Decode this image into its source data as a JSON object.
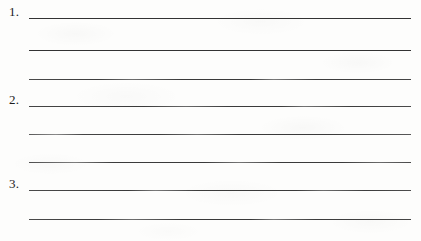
{
  "document": {
    "type": "worksheet-answer-lines",
    "title": "Numbered blank answer lines",
    "background_color": "#fdfdfc",
    "rule_color": "#3a3a3a",
    "text_color": "#1c1c1c",
    "total_rules": 8,
    "numbered_items": 3
  },
  "items": [
    {
      "number": "1.",
      "has_number": true,
      "rule_index": 1,
      "y": 18,
      "line_style": "solid",
      "text": ""
    },
    {
      "number": "",
      "has_number": false,
      "rule_index": 2,
      "y": 50,
      "line_style": "solid",
      "text": ""
    },
    {
      "number": "",
      "has_number": false,
      "rule_index": 3,
      "y": 79,
      "line_style": "faded-a",
      "text": ""
    },
    {
      "number": "2.",
      "has_number": true,
      "rule_index": 4,
      "y": 106,
      "line_style": "faded-b",
      "text": ""
    },
    {
      "number": "",
      "has_number": false,
      "rule_index": 5,
      "y": 134,
      "line_style": "faded-c",
      "text": ""
    },
    {
      "number": "",
      "has_number": false,
      "rule_index": 6,
      "y": 162,
      "line_style": "faded-d",
      "text": ""
    },
    {
      "number": "3.",
      "has_number": true,
      "rule_index": 7,
      "y": 190,
      "line_style": "faded-e",
      "text": ""
    },
    {
      "number": "",
      "has_number": false,
      "rule_index": 8,
      "y": 219,
      "line_style": "faded-a",
      "text": ""
    }
  ]
}
